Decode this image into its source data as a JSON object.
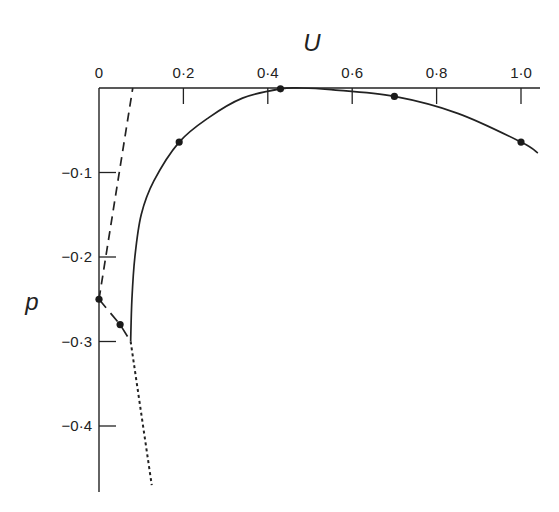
{
  "chart_data": {
    "type": "line",
    "title": "",
    "xlabel": "U",
    "ylabel": "p",
    "x_axis_position": "top",
    "xlim": [
      0,
      1.05
    ],
    "ylim": [
      -0.47,
      0
    ],
    "grid": false,
    "legend": null,
    "x_ticks": [
      {
        "value": 0,
        "label": "0"
      },
      {
        "value": 0.2,
        "label": "0·2"
      },
      {
        "value": 0.4,
        "label": "0·4"
      },
      {
        "value": 0.6,
        "label": "0·6"
      },
      {
        "value": 0.8,
        "label": "0·8"
      },
      {
        "value": 1.0,
        "label": "1·0"
      }
    ],
    "y_ticks": [
      {
        "value": -0.1,
        "label": "−0·1"
      },
      {
        "value": -0.2,
        "label": "−0·2"
      },
      {
        "value": -0.3,
        "label": "−0·3"
      },
      {
        "value": -0.4,
        "label": "−0·4"
      }
    ],
    "series": [
      {
        "name": "solid-curve",
        "style": "solid",
        "x": [
          0.075,
          0.078,
          0.085,
          0.1,
          0.13,
          0.19,
          0.26,
          0.34,
          0.43,
          0.48,
          0.55,
          0.7,
          0.85,
          1.0,
          1.04
        ],
        "y": [
          -0.3,
          -0.25,
          -0.2,
          -0.15,
          -0.11,
          -0.064,
          -0.035,
          -0.012,
          -0.001,
          0.0,
          -0.002,
          -0.01,
          -0.03,
          -0.064,
          -0.077
        ]
      },
      {
        "name": "dashed-line",
        "style": "dashed",
        "x": [
          0.0,
          0.08
        ],
        "y": [
          -0.25,
          0.0
        ]
      },
      {
        "name": "dash-dot-segment",
        "style": "long-dash",
        "x": [
          0.0,
          0.05,
          0.075
        ],
        "y": [
          -0.25,
          -0.28,
          -0.3
        ]
      },
      {
        "name": "dotted-line",
        "style": "dotted",
        "x": [
          0.075,
          0.125
        ],
        "y": [
          -0.3,
          -0.47
        ]
      }
    ],
    "markers": [
      {
        "x": 0.0,
        "y": -0.25
      },
      {
        "x": 0.05,
        "y": -0.28
      },
      {
        "x": 0.19,
        "y": -0.064
      },
      {
        "x": 0.43,
        "y": -0.001
      },
      {
        "x": 0.7,
        "y": -0.01
      },
      {
        "x": 1.0,
        "y": -0.064
      }
    ]
  }
}
